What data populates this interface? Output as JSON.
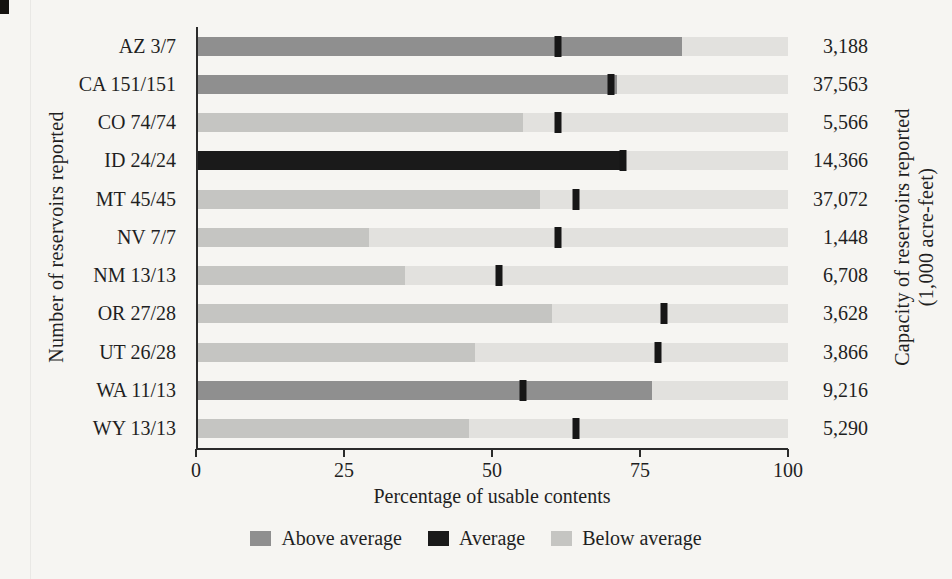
{
  "chart_data": {
    "type": "bar",
    "orientation": "horizontal",
    "title": "",
    "xlabel": "Percentage of usable contents",
    "left_axis_title": "Number of reservoirs reported",
    "right_axis_title_line1": "Capacity of reservoirs reported",
    "right_axis_title_line2": "(1,000 acre-feet)",
    "x_ticks": [
      0,
      25,
      50,
      75,
      100
    ],
    "xlim": [
      0,
      100
    ],
    "grid": false,
    "legend_position": "bottom",
    "legend": [
      {
        "label": "Above average",
        "status": "above",
        "color": "#8f8f8f"
      },
      {
        "label": "Average",
        "status": "average",
        "color": "#1a1a1a"
      },
      {
        "label": "Below average",
        "status": "below",
        "color": "#c5c5c2"
      }
    ],
    "track_color": "#e2e1de",
    "average_tick_color": "#161616",
    "rows": [
      {
        "state": "AZ 3/7",
        "capacity": "3,188",
        "percent_full": 82,
        "average": 61,
        "status": "above"
      },
      {
        "state": "CA 151/151",
        "capacity": "37,563",
        "percent_full": 71,
        "average": 70,
        "status": "above"
      },
      {
        "state": "CO 74/74",
        "capacity": "5,566",
        "percent_full": 55,
        "average": 61,
        "status": "below"
      },
      {
        "state": "ID 24/24",
        "capacity": "14,366",
        "percent_full": 72,
        "average": 72,
        "status": "average"
      },
      {
        "state": "MT 45/45",
        "capacity": "37,072",
        "percent_full": 58,
        "average": 64,
        "status": "below"
      },
      {
        "state": "NV 7/7",
        "capacity": "1,448",
        "percent_full": 29,
        "average": 61,
        "status": "below"
      },
      {
        "state": "NM 13/13",
        "capacity": "6,708",
        "percent_full": 35,
        "average": 51,
        "status": "below"
      },
      {
        "state": "OR 27/28",
        "capacity": "3,628",
        "percent_full": 60,
        "average": 79,
        "status": "below"
      },
      {
        "state": "UT 26/28",
        "capacity": "3,866",
        "percent_full": 47,
        "average": 78,
        "status": "below"
      },
      {
        "state": "WA 11/13",
        "capacity": "9,216",
        "percent_full": 77,
        "average": 55,
        "status": "above"
      },
      {
        "state": "WY 13/13",
        "capacity": "5,290",
        "percent_full": 46,
        "average": 64,
        "status": "below"
      }
    ]
  }
}
